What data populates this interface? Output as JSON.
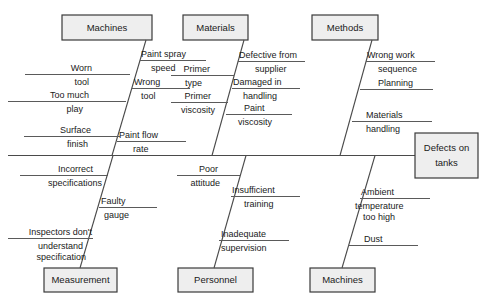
{
  "diagram": {
    "type": "fishbone-ishikawa-cause-effect",
    "effect": {
      "label_line1": "Defects on",
      "label_line2": "tanks"
    },
    "caption": "",
    "colors": {
      "box_fill": "#eeeeee",
      "box_border": "#3a3a3a",
      "line": "#4a4a4a",
      "text": "#1a1a1a",
      "background": "#ffffff"
    },
    "categories": [
      {
        "id": "machines-top",
        "label": "Machines",
        "position": "top",
        "causes_right": [
          {
            "line1": "Paint spray",
            "line2": "speed"
          },
          {
            "line1": "Wrong",
            "line2": "tool"
          },
          {
            "line1": "Paint flow",
            "line2": "rate"
          }
        ],
        "causes_left": [
          {
            "line1": "Worn",
            "line2": "tool"
          },
          {
            "line1": "Too much",
            "line2": "play"
          },
          {
            "line1": "Surface",
            "line2": "finish"
          }
        ]
      },
      {
        "id": "materials-top",
        "label": "Materials",
        "position": "top",
        "causes_right": [
          {
            "line1": "Defective from",
            "line2": "supplier"
          },
          {
            "line1": "Damaged in",
            "line2": "handling"
          },
          {
            "line1": "Paint",
            "line2": "viscosity"
          }
        ],
        "causes_left": [
          {
            "line1": "Primer",
            "line2": "type"
          },
          {
            "line1": "Primer",
            "line2": "viscosity"
          }
        ]
      },
      {
        "id": "methods-top",
        "label": "Methods",
        "position": "top",
        "causes_right": [
          {
            "line1": "Wrong work",
            "line2": "sequence"
          },
          {
            "line1": "Planning",
            "line2": ""
          },
          {
            "line1": "Materials",
            "line2": "handling"
          }
        ],
        "causes_left": []
      },
      {
        "id": "measurement-bottom",
        "label": "Measurement",
        "position": "bottom",
        "causes_right": [
          {
            "line1": "Faulty",
            "line2": "gauge"
          }
        ],
        "causes_left": [
          {
            "line1": "Incorrect",
            "line2": "specifications"
          },
          {
            "line1": "Inspectors don't",
            "line2": "understand",
            "line3": "specification"
          }
        ]
      },
      {
        "id": "personnel-bottom",
        "label": "Personnel",
        "position": "bottom",
        "causes_right": [
          {
            "line1": "Insufficient",
            "line2": "training"
          },
          {
            "line1": "Inadequate",
            "line2": "supervision"
          }
        ],
        "causes_left": [
          {
            "line1": "Poor",
            "line2": "attitude"
          }
        ]
      },
      {
        "id": "machines-bottom",
        "label": "Machines",
        "position": "bottom",
        "causes_right": [
          {
            "line1": "Ambient",
            "line2": "temperature",
            "line3": "too high"
          },
          {
            "line1": "Dust",
            "line2": ""
          }
        ],
        "causes_left": []
      }
    ]
  }
}
